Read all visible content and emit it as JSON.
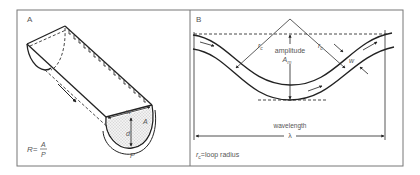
{
  "panels": {
    "a": {
      "label": "A",
      "labels": {
        "width": "w",
        "depth": "d",
        "area": "A",
        "perimeter": "P"
      },
      "formula": {
        "lhs": "R=",
        "numerator": "A",
        "denominator": "P"
      }
    },
    "b": {
      "label": "B",
      "amplitude_label": "amplitude",
      "amplitude_symbol": "A",
      "amplitude_subscript": "m",
      "radius_symbol": "r",
      "radius_subscript": "c",
      "width_label": "w",
      "wavelength_label": "wavelength",
      "wavelength_symbol": "λ",
      "legend": {
        "symbol": "r",
        "subscript": "c",
        "text": "=loop radius"
      }
    }
  },
  "colors": {
    "line": "#222222",
    "frame": "#666666",
    "text": "#555555",
    "fill_dots": "#9a9a9a"
  }
}
